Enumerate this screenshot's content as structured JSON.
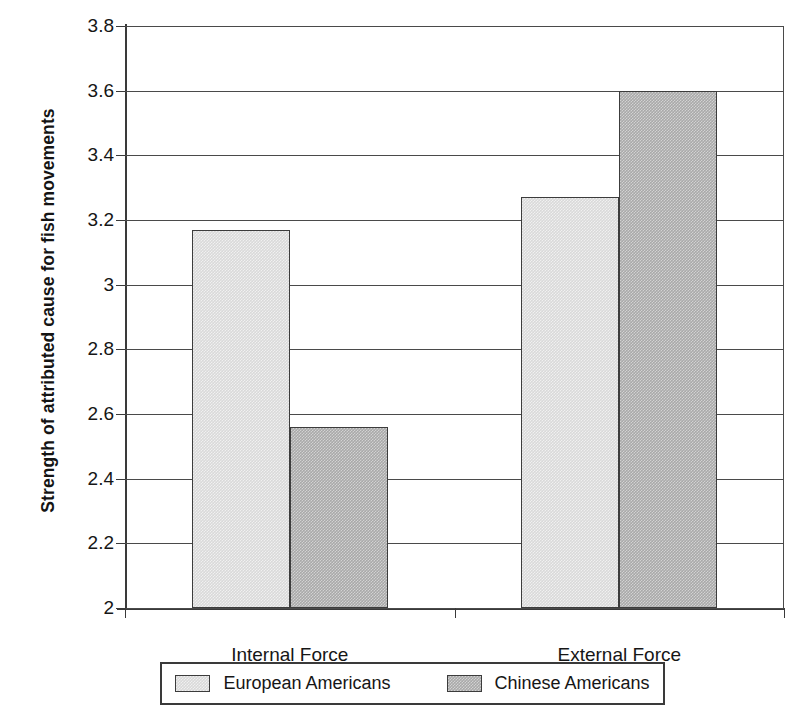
{
  "chart_data": {
    "type": "bar",
    "title": "",
    "xlabel": "",
    "ylabel": "Strength of attributed cause for fish movements",
    "categories": [
      "Internal Force",
      "External Force"
    ],
    "series": [
      {
        "name": "European Americans",
        "values": [
          3.17,
          3.27
        ],
        "color": "#d9d9d9"
      },
      {
        "name": "Chinese Americans",
        "values": [
          2.56,
          3.6
        ],
        "color": "#a9a9a9"
      }
    ],
    "ylim": [
      2,
      3.8
    ],
    "ytick_labels": [
      "3.8",
      "3.6",
      "3.4",
      "3.2",
      "3",
      "2.8",
      "2.6",
      "2.4",
      "2.2",
      "2"
    ],
    "ytick_values": [
      3.8,
      3.6,
      3.4,
      3.2,
      3.0,
      2.8,
      2.6,
      2.4,
      2.2,
      2.0
    ],
    "ytick_step": 0.2,
    "grid": true,
    "grid_axis": "y",
    "legend_position": "bottom",
    "bar_border_color": "#3c3c3c",
    "axis_color": "#3a3a3a"
  },
  "legend": {
    "entries": [
      {
        "label": "European Americans"
      },
      {
        "label": "Chinese Americans"
      }
    ]
  }
}
